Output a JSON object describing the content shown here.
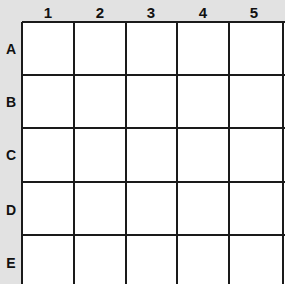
{
  "grid": {
    "columns": [
      "1",
      "2",
      "3",
      "4",
      "5"
    ],
    "rows": [
      "A",
      "B",
      "C",
      "D",
      "E"
    ],
    "cells": "empty",
    "colors": {
      "background": "#e2e2e2",
      "cell": "#ffffff",
      "line": "#1a1a1a"
    }
  }
}
